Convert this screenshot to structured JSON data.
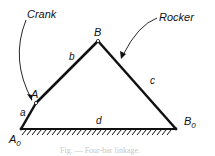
{
  "diagram": {
    "title": "Four-bar linkage",
    "labels": {
      "crank": "Crank",
      "rocker": "Rocker",
      "pivot_a0": "A",
      "pivot_a0_sub": "0",
      "joint_a": "A",
      "joint_b": "B",
      "pivot_b0": "B",
      "pivot_b0_sub": "0",
      "link_a": "a",
      "link_b": "b",
      "link_c": "c",
      "link_d": "d"
    },
    "caption": "Fig. — Four-bar linkage.",
    "colors": {
      "ink": "#111111",
      "caption": "#c8c8c8"
    }
  }
}
